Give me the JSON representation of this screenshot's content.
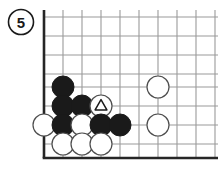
{
  "diagram": {
    "badge": {
      "label": "5",
      "name": "diagram-number-badge",
      "cx": 21,
      "cy": 22,
      "r": 12.5
    },
    "board": {
      "edge_color": "#262626",
      "grid_color": "#9a9a9a",
      "background": "#ffffff",
      "left_edge_x": 44,
      "bottom_edge_y": 158,
      "right_extent_x": 218,
      "top_extent_y": 10,
      "spacing": 19,
      "grid_x": [
        44,
        63,
        82,
        101,
        120,
        139,
        158,
        177,
        196,
        215
      ],
      "grid_y": [
        17,
        36,
        55,
        74,
        87,
        106,
        125,
        144,
        158
      ],
      "vertical_lines_x": [
        63,
        82,
        101,
        120,
        139,
        158,
        177,
        196,
        215
      ],
      "horizontal_lines_y": [
        17,
        36,
        55,
        74,
        87,
        106,
        125,
        144
      ]
    },
    "stones": [
      {
        "color": "black",
        "x": 63,
        "y": 87,
        "mark": "none"
      },
      {
        "color": "black",
        "x": 63,
        "y": 106,
        "mark": "none"
      },
      {
        "color": "black",
        "x": 82,
        "y": 106,
        "mark": "none"
      },
      {
        "color": "white",
        "x": 101,
        "y": 106,
        "mark": "triangle"
      },
      {
        "color": "white",
        "x": 158,
        "y": 87,
        "mark": "none"
      },
      {
        "color": "white",
        "x": 44,
        "y": 125,
        "mark": "none"
      },
      {
        "color": "black",
        "x": 63,
        "y": 125,
        "mark": "none"
      },
      {
        "color": "white",
        "x": 82,
        "y": 125,
        "mark": "none"
      },
      {
        "color": "black",
        "x": 101,
        "y": 125,
        "mark": "none"
      },
      {
        "color": "black",
        "x": 120,
        "y": 125,
        "mark": "none"
      },
      {
        "color": "white",
        "x": 158,
        "y": 125,
        "mark": "none"
      },
      {
        "color": "white",
        "x": 63,
        "y": 144,
        "mark": "none"
      },
      {
        "color": "white",
        "x": 82,
        "y": 144,
        "mark": "none"
      },
      {
        "color": "white",
        "x": 101,
        "y": 144,
        "mark": "none"
      }
    ],
    "style": {
      "stone_radius": 11,
      "black_fill": "#1a1a1a",
      "black_stroke": "#1a1a1a",
      "white_fill": "#ffffff",
      "white_stroke": "#4d4d4d",
      "triangle_stroke": "#1a1a1a"
    }
  }
}
